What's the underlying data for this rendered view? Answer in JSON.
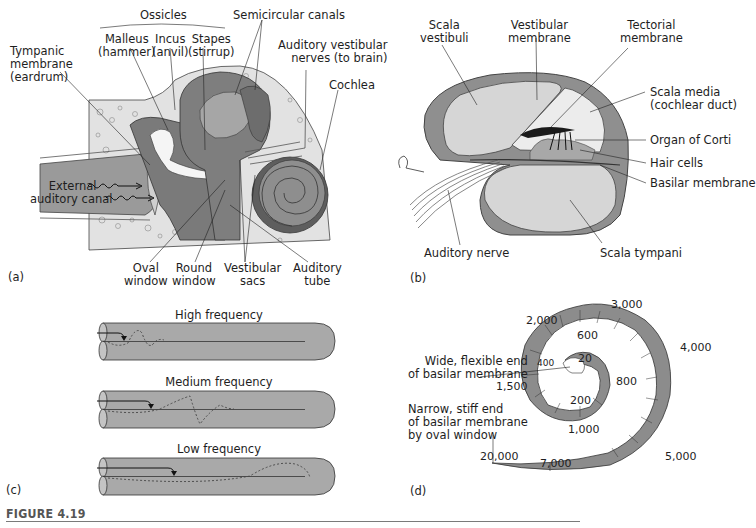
{
  "figure": {
    "caption": "FIGURE 4.19",
    "colors": {
      "dark_gray": "#6e6e6e",
      "mid_gray": "#8f8f8f",
      "light_gray": "#d4d4d4",
      "bone": "#e6e6e6",
      "tube_fill": "#a9a9a9",
      "ring_fill": "#8c8c8c",
      "line": "#222222",
      "rule": "#7a7a7a"
    }
  },
  "panel_a": {
    "tag": "(a)",
    "labels": {
      "ossicles": "Ossicles",
      "malleus": "Malleus",
      "malleus_sub": "(hammer)",
      "incus": "Incus",
      "incus_sub": "(anvil)",
      "stapes": "Stapes",
      "stapes_sub": "(stirrup)",
      "semicircular": "Semicircular canals",
      "nerves_1": "Auditory vestibular",
      "nerves_2": "nerves (to brain)",
      "cochlea": "Cochlea",
      "tympanic_1": "Tympanic",
      "tympanic_2": "membrane",
      "tympanic_3": "(eardrum)",
      "canal_1": "External",
      "canal_2": "auditory canal",
      "oval_1": "Oval",
      "oval_2": "window",
      "round_1": "Round",
      "round_2": "window",
      "vestib_1": "Vestibular",
      "vestib_2": "sacs",
      "tube_1": "Auditory",
      "tube_2": "tube"
    }
  },
  "panel_b": {
    "tag": "(b)",
    "labels": {
      "scala_vestibuli_1": "Scala",
      "scala_vestibuli_2": "vestibuli",
      "vestibular_membrane_1": "Vestibular",
      "vestibular_membrane_2": "membrane",
      "tectorial_1": "Tectorial",
      "tectorial_2": "membrane",
      "scala_media_1": "Scala media",
      "scala_media_2": "(cochlear duct)",
      "organ_corti": "Organ of Corti",
      "hair_cells": "Hair cells",
      "basilar": "Basilar membrane",
      "auditory_nerve": "Auditory nerve",
      "scala_tympani": "Scala tympani"
    }
  },
  "panel_c": {
    "tag": "(c)",
    "tubes": [
      {
        "title": "High frequency"
      },
      {
        "title": "Medium frequency"
      },
      {
        "title": "Low frequency"
      }
    ]
  },
  "panel_d": {
    "tag": "(d)",
    "wide_1": "Wide, flexible end",
    "wide_2": "of basilar membrane",
    "narrow_1": "Narrow, stiff end",
    "narrow_2": "of basilar membrane",
    "narrow_3": "by oval window",
    "frequencies": [
      "20",
      "200",
      "400",
      "600",
      "800",
      "1,000",
      "1,500",
      "2,000",
      "3,000",
      "4,000",
      "5,000",
      "7,000",
      "20,000"
    ]
  }
}
